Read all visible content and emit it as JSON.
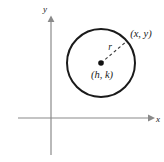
{
  "figure": {
    "background_color": "#ffffff",
    "axis_color": "#8a8a8a",
    "curve_color": "#1a1a1a",
    "label_color": "#1a1a1a",
    "axes": {
      "x_axis_label": "x",
      "y_axis_label": "y",
      "x_axis_y_pixel": 118,
      "y_axis_x_pixel": 51,
      "x_axis_start": 18,
      "x_axis_end": 150,
      "y_axis_start": 20,
      "y_axis_end": 155,
      "arrowheads": [
        "x-positive",
        "y-positive"
      ],
      "origin_label": ""
    },
    "circle": {
      "center_label": "(h, k)",
      "point_on_circle_label": "(x, y)",
      "radius_label": "r",
      "center_x_pixel": 101,
      "center_y_pixel": 63,
      "radius_pixel": 34,
      "stroke_width": 2,
      "center_dot_radius": 2.6,
      "radius_line_style": "dashed",
      "radius_line_end_x_pixel": 127,
      "radius_line_end_y_pixel": 41
    }
  }
}
